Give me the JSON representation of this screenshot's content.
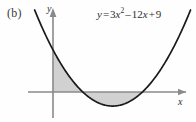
{
  "figure": {
    "part_label": "(b)",
    "equation": {
      "lhs": "y",
      "equals": "=",
      "coef_quad": "3",
      "var_quad": "x",
      "exponent": "2",
      "minus": "–",
      "coef_lin": "12",
      "var_lin": "x",
      "plus": "+",
      "constant": "9",
      "full": "y = 3x² – 12x + 9"
    },
    "axes": {
      "x_label": "x",
      "y_label": "y"
    },
    "colors": {
      "curve": "#1a1a1a",
      "axis": "#8a8a8a",
      "shade": "#c9c9c9",
      "background": "#fefefe",
      "text": "#2e2e2e"
    }
  },
  "chart_data": {
    "type": "line",
    "title": "",
    "subtitle": "",
    "xlabel": "x",
    "ylabel": "y",
    "grid": false,
    "legend": "none",
    "function": "y = 3x^2 - 12x + 9",
    "coefficients": {
      "a": 3,
      "b": -12,
      "c": 9
    },
    "roots": [
      1,
      3
    ],
    "vertex": {
      "x": 2,
      "y": -3
    },
    "y_intercept": 9,
    "xlim": [
      -0.6,
      4.2
    ],
    "ylim": [
      -5.5,
      14
    ],
    "shaded_regions": [
      {
        "from": 0,
        "to": 1,
        "sign": "positive",
        "label": "area above x-axis"
      },
      {
        "from": 1,
        "to": 3,
        "sign": "negative",
        "label": "area below x-axis"
      }
    ],
    "x": [
      -0.6,
      -0.4,
      -0.2,
      0,
      0.2,
      0.4,
      0.6,
      0.8,
      1,
      1.2,
      1.4,
      1.6,
      1.8,
      2,
      2.2,
      2.4,
      2.6,
      2.8,
      3,
      3.2,
      3.4,
      3.6,
      3.8,
      4,
      4.2
    ],
    "y": [
      17.28,
      14.28,
      11.52,
      9,
      6.72,
      4.68,
      2.88,
      1.32,
      0,
      -1.08,
      -1.92,
      -2.52,
      -2.88,
      -3,
      -2.88,
      -2.52,
      -1.92,
      -1.08,
      0,
      1.32,
      2.88,
      4.68,
      6.72,
      9,
      11.52
    ]
  }
}
